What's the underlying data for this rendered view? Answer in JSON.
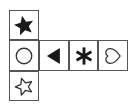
{
  "figure": {
    "title": "",
    "type": "cube-net-diagram",
    "background_color": "#ffffff",
    "border_color": "#555555",
    "fill_color": "#1a1a1a",
    "outline_color": "#333333",
    "rows": 3,
    "columns": 4,
    "cells": [
      {
        "id": "cell-top",
        "row": 0,
        "column": 0,
        "icon": "filled-star-icon",
        "label": "filled five-pointed star",
        "style": "filled"
      },
      {
        "id": "cell-middle-1",
        "row": 1,
        "column": 0,
        "icon": "circle-outline-icon",
        "label": "hollow circle",
        "style": "outline"
      },
      {
        "id": "cell-middle-2",
        "row": 1,
        "column": 1,
        "icon": "left-triangle-icon",
        "label": "filled left-pointing triangle",
        "style": "filled"
      },
      {
        "id": "cell-middle-3",
        "row": 1,
        "column": 2,
        "icon": "asterisk-icon",
        "label": "six-spoke asterisk",
        "style": "filled"
      },
      {
        "id": "cell-middle-4",
        "row": 1,
        "column": 3,
        "icon": "heart-outline-icon",
        "label": "hollow heart rotated right",
        "style": "outline"
      },
      {
        "id": "cell-bottom",
        "row": 2,
        "column": 0,
        "icon": "star-outline-icon",
        "label": "hollow five-pointed star",
        "style": "outline"
      }
    ]
  }
}
